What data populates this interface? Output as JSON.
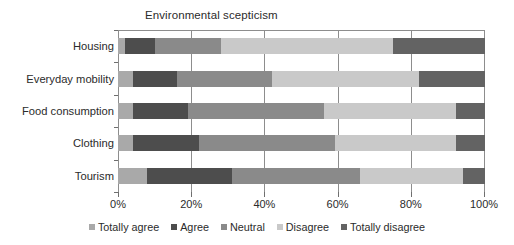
{
  "chart_data": {
    "type": "bar",
    "orientation": "horizontal",
    "stacked": true,
    "stack_mode": "percent",
    "title": "Environmental scepticism",
    "xlabel": "",
    "ylabel": "",
    "xlim": [
      0,
      100
    ],
    "xticks": [
      0,
      20,
      40,
      60,
      80,
      100
    ],
    "xtick_labels": [
      "0%",
      "20%",
      "40%",
      "60%",
      "80%",
      "100%"
    ],
    "grid": true,
    "grid_axis": "x",
    "legend_position": "bottom",
    "categories": [
      "Housing",
      "Everyday mobility",
      "Food consumption",
      "Clothing",
      "Tourism"
    ],
    "series": [
      {
        "name": "Totally agree",
        "color": "#a9a9a9",
        "values": [
          2,
          4,
          4,
          4,
          8
        ]
      },
      {
        "name": "Agree",
        "color": "#4d4d4d",
        "values": [
          8,
          12,
          15,
          18,
          23
        ]
      },
      {
        "name": "Neutral",
        "color": "#8a8a8a",
        "values": [
          18,
          26,
          37,
          37,
          35
        ]
      },
      {
        "name": "Disagree",
        "color": "#c9c9c9",
        "values": [
          47,
          40,
          36,
          33,
          28
        ]
      },
      {
        "name": "Totally disagree",
        "color": "#636363",
        "values": [
          25,
          18,
          8,
          8,
          6
        ]
      }
    ],
    "cumulative": {
      "Housing": [
        2,
        10,
        28,
        75,
        100
      ],
      "Everyday mobility": [
        4,
        16,
        42,
        82,
        100
      ],
      "Food consumption": [
        4,
        19,
        56,
        92,
        100
      ],
      "Clothing": [
        4,
        22,
        59,
        92,
        100
      ],
      "Tourism": [
        8,
        31,
        66,
        94,
        100
      ]
    }
  },
  "legend": {
    "items": [
      {
        "label": "Totally agree",
        "color": "#a9a9a9"
      },
      {
        "label": "Agree",
        "color": "#4d4d4d"
      },
      {
        "label": "Neutral",
        "color": "#8a8a8a"
      },
      {
        "label": "Disagree",
        "color": "#c9c9c9"
      },
      {
        "label": "Totally disagree",
        "color": "#636363"
      }
    ]
  }
}
